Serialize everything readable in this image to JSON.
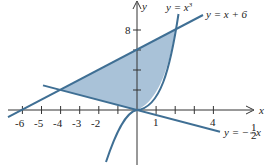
{
  "figure": {
    "type": "region-between-curves",
    "axes": {
      "x_label": "x",
      "y_label": "y",
      "x_ticks": [
        "-6",
        "-5",
        "-4",
        "-3",
        "-2",
        "1",
        "4"
      ],
      "y_ticks": [
        "8"
      ]
    },
    "curves": [
      {
        "name": "cubic",
        "label": "y = x",
        "exponent": "3"
      },
      {
        "name": "line-upper",
        "label": "y = x + 6"
      },
      {
        "name": "line-lower",
        "label_prefix": "y = −",
        "frac_num": "1",
        "frac_den": "2",
        "label_suffix": "x"
      }
    ],
    "shaded_region": "bounded by y = x + 6, y = x^3, and y = −x/2",
    "intersections": [
      {
        "x": -4,
        "y": 2
      },
      {
        "x": 2,
        "y": 8
      },
      {
        "x": 0,
        "y": 0
      }
    ],
    "colors": {
      "curve": "#3f6f94",
      "fill": "#a9c2d8",
      "axis": "#333333"
    }
  }
}
